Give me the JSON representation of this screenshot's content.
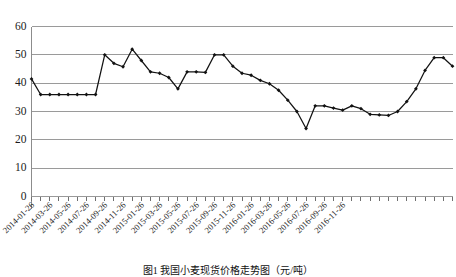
{
  "caption": "图1  我国小麦现货价格走势图（元/吨）",
  "chart_data": {
    "type": "line",
    "title": "",
    "subtitle": "",
    "xlabel": "",
    "ylabel": "",
    "grid": true,
    "legend": false,
    "ylim": [
      0,
      60
    ],
    "yticks": [
      0,
      10,
      20,
      30,
      40,
      50,
      60
    ],
    "ytick_labels": [
      "0",
      "10",
      "20",
      "30",
      "40",
      "50",
      "60"
    ],
    "x": [
      "2014-01-26",
      "2014-02-26",
      "2014-03-26",
      "2014-04-26",
      "2014-05-26",
      "2014-06-26",
      "2014-07-26",
      "2014-08-26",
      "2014-09-26",
      "2014-10-26",
      "2014-11-26",
      "2014-12-26",
      "2015-01-26",
      "2015-02-26",
      "2015-03-26",
      "2015-04-26",
      "2015-05-26",
      "2015-06-26",
      "2015-07-26",
      "2015-08-26",
      "2015-09-26",
      "2015-10-26",
      "2015-11-26",
      "2015-12-26",
      "2016-01-26",
      "2016-02-26",
      "2016-03-26",
      "2016-04-26",
      "2016-05-26",
      "2016-06-26",
      "2016-07-26",
      "2016-08-26",
      "2016-09-26",
      "2016-10-26",
      "2016-11-26",
      "2016-12-26"
    ],
    "xtick_labels": [
      "2014-01-26",
      "2014-03-26",
      "2014-05-26",
      "2014-07-26",
      "2014-09-26",
      "2014-11-26",
      "2015-01-26",
      "2015-03-26",
      "2015-05-26",
      "2015-07-26",
      "2015-09-26",
      "2015-11-26",
      "2016-01-26",
      "2016-03-26",
      "2016-05-26",
      "2016-07-26",
      "2016-09-26",
      "2016-11-26"
    ],
    "xtick_label_rotation": -45,
    "series": [
      {
        "name": "价格",
        "color": "#121212",
        "marker": "diamond",
        "values": [
          41.5,
          36,
          36,
          36,
          36,
          36,
          36,
          36,
          50,
          47,
          45.8,
          52,
          48,
          44,
          43.5,
          42,
          38,
          44,
          44,
          43.8,
          50,
          50,
          46,
          43.5,
          42.8,
          41,
          39.8,
          37.5,
          34,
          30,
          24,
          32,
          32,
          31.2,
          30.5,
          32
        ]
      }
    ],
    "series_extended_values": [
      41.5,
      36,
      36,
      36,
      36,
      36,
      36,
      36,
      50,
      47,
      45.8,
      52,
      48,
      44,
      43.5,
      42,
      38,
      44,
      44,
      43.8,
      50,
      50,
      46,
      43.5,
      42.8,
      41,
      39.8,
      37.5,
      34,
      30,
      24,
      32,
      32,
      31.2,
      30.5,
      32,
      31,
      29,
      28.8,
      28.6,
      30,
      33.5,
      38,
      44.5,
      49,
      49,
      46
    ]
  }
}
